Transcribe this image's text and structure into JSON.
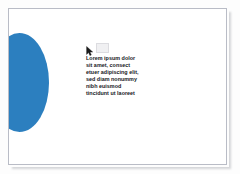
{
  "canvas": {
    "background_color": "#fdfdfd",
    "page_background_color": "#ffffff",
    "page_border_color": "#b9bcc6"
  },
  "shapes": {
    "circle": {
      "name": "blue-ellipse",
      "fill_color": "#2c7fbf",
      "clipped_left_edge": true
    }
  },
  "markers": {
    "cursor_icon": "mouse-pointer-icon",
    "placeholder_icon": "ghost-placeholder-icon"
  },
  "text_block": {
    "content": "Lorem ipsum dolor\nsit amet, consect\netuer adipiscing elit,\nsed diam nonummy\nnibh euismod\ntincidunt ut laoreet",
    "lines": [
      "Lorem ipsum dolor",
      "sit amet, consect",
      "etuer adipiscing elit,",
      "sed diam nonummy",
      "nibh euismod",
      "tincidunt ut laoreet"
    ],
    "color": "#16181c"
  }
}
